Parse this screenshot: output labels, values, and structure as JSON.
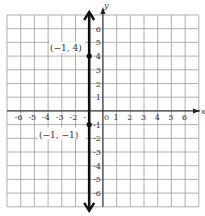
{
  "chart_data": {
    "type": "line",
    "title": "",
    "xlabel": "x",
    "ylabel": "y",
    "xlim": [
      -6.5,
      7
    ],
    "ylim": [
      -7,
      7
    ],
    "grid": true,
    "x_ticks": [
      "-6",
      "-5",
      "-4",
      "-3",
      "-2",
      "-",
      "0",
      "1",
      "2",
      "3",
      "4",
      "5",
      "6"
    ],
    "y_ticks": [
      "6",
      "5",
      "4",
      "3",
      "2",
      "1",
      "-1",
      "-2",
      "-3",
      "-4",
      "-5",
      "-6"
    ],
    "series": [
      {
        "name": "vertical line x = -1",
        "line": "x = -1",
        "points": [
          {
            "x": -1,
            "y": 4,
            "label": "(−1, 4)"
          },
          {
            "x": -1,
            "y": -1,
            "label": "(−1, −1)"
          }
        ]
      }
    ],
    "annotations": [
      "(−1, 4)",
      "(−1, −1)"
    ]
  },
  "labels": {
    "x_axis": "x",
    "y_axis": "y",
    "point_a": "(−1, 4)",
    "point_b": "(−1, −1)",
    "origin": "0"
  }
}
